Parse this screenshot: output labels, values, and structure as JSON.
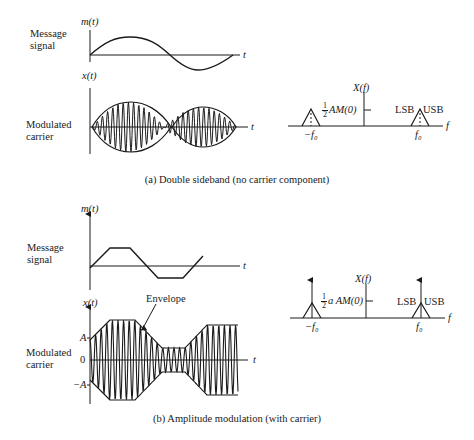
{
  "panel_a": {
    "message_label_line1": "Message",
    "message_label_line2": "signal",
    "message_axis_label": "m(t)",
    "modulated_label_line1": "Modulated",
    "modulated_label_line2": "carrier",
    "modulated_axis_label": "x(t)",
    "time_axis": "t",
    "spectrum_axis_label": "X(f)",
    "spectrum_freq_axis": "f",
    "spectrum_amplitude_frac_num": "1",
    "spectrum_amplitude_frac_den": "2",
    "spectrum_amplitude": "AM(0)",
    "neg_carrier_freq": "−f₀",
    "pos_carrier_freq": "f₀",
    "lsb": "LSB",
    "usb": "USB",
    "caption": "(a) Double sideband (no carrier component)"
  },
  "panel_b": {
    "message_label_line1": "Message",
    "message_label_line2": "signal",
    "message_axis_label": "m(t)",
    "modulated_label_line1": "Modulated",
    "modulated_label_line2": "carrier",
    "modulated_axis_label": "x(t)",
    "time_axis": "t",
    "envelope_label": "Envelope",
    "tick_pos": "A",
    "tick_zero": "0",
    "tick_neg": "−A",
    "spectrum_axis_label": "X(f)",
    "spectrum_freq_axis": "f",
    "spectrum_amplitude_frac_num": "1",
    "spectrum_amplitude_frac_den": "2",
    "spectrum_amplitude": "a AM(0)",
    "neg_carrier_freq": "−f₀",
    "pos_carrier_freq": "f₀",
    "lsb": "LSB",
    "usb": "USB",
    "caption": "(b) Amplitude modulation (with carrier)"
  }
}
